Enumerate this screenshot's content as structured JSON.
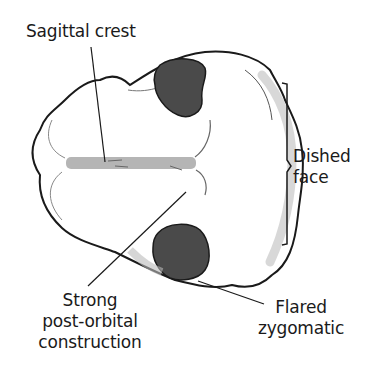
{
  "diagram": {
    "colors": {
      "outline": "#1a1a1a",
      "orbit_fill": "#4a4a4a",
      "crest_fill": "#a8a8a8",
      "shading": "#d8d8d8",
      "background": "#ffffff"
    },
    "labels": {
      "sagittal_crest": "Sagittal crest",
      "dished_face": {
        "line1": "Dished",
        "line2": "face"
      },
      "post_orbital": {
        "line1": "Strong",
        "line2": "post-orbital",
        "line3": "construction"
      },
      "flared_zygomatic": {
        "line1": "Flared",
        "line2": "zygomatic"
      }
    }
  }
}
